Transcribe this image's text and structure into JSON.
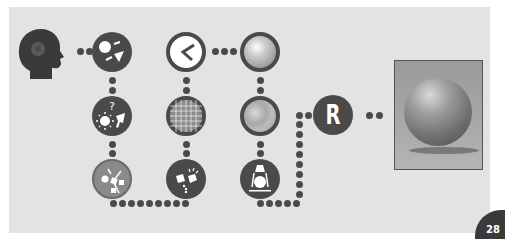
{
  "diagram": {
    "type": "rendering pipeline flow",
    "nodes": [
      {
        "id": "viewer",
        "icon": "head-silhouette-icon"
      },
      {
        "id": "light-camera",
        "icon": "light-and-camera-icon"
      },
      {
        "id": "lighting-question",
        "icon": "light-and-spotlight-question-icon"
      },
      {
        "id": "light-scatter",
        "icon": "light-scatter-icon"
      },
      {
        "id": "color-light",
        "icon": "light-bounce-icon"
      },
      {
        "id": "shape-angle",
        "icon": "angle-icon"
      },
      {
        "id": "wireframe-sphere",
        "icon": "wireframe-grid-sphere-icon"
      },
      {
        "id": "shaded-sphere",
        "icon": "shaded-sphere-icon"
      },
      {
        "id": "texture-sphere",
        "icon": "textured-sphere-icon"
      },
      {
        "id": "lamp-object",
        "icon": "lamp-lit-object-icon"
      },
      {
        "id": "render",
        "label": "R"
      },
      {
        "id": "result",
        "icon": "rendered-sphere-photo"
      }
    ]
  },
  "page": {
    "number": "28"
  },
  "colors": {
    "panel": "#e3e3e3",
    "node": "#4a4a4a",
    "badge": "#3a3a3a"
  }
}
